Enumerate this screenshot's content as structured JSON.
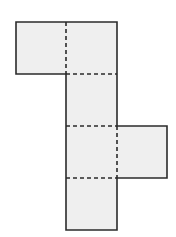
{
  "diagram": {
    "type": "cube-net",
    "face_fill": "#efefef",
    "outline_color": "#2b2b2b",
    "fold_line_style": "dashed",
    "faces": [
      {
        "id": "face-top-left",
        "x": 16,
        "y": 22,
        "w": 50,
        "h": 52
      },
      {
        "id": "face-top",
        "x": 66,
        "y": 22,
        "w": 51,
        "h": 52
      },
      {
        "id": "face-middle-1",
        "x": 66,
        "y": 74,
        "w": 51,
        "h": 52
      },
      {
        "id": "face-middle-2",
        "x": 66,
        "y": 126,
        "w": 51,
        "h": 52
      },
      {
        "id": "face-right",
        "x": 117,
        "y": 126,
        "w": 50,
        "h": 52
      },
      {
        "id": "face-bottom",
        "x": 66,
        "y": 178,
        "w": 51,
        "h": 52
      }
    ]
  }
}
